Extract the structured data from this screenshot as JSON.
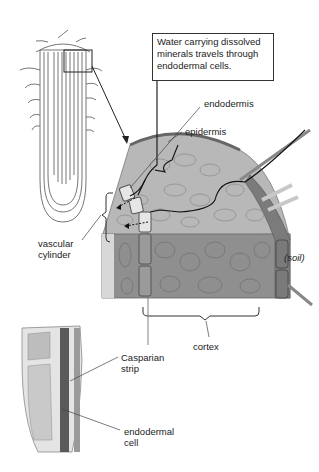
{
  "callout": {
    "lines": [
      "Water carrying dissolved",
      "minerals travels through",
      "endodermal cells."
    ]
  },
  "labels": {
    "endodermis": "endodermis",
    "epidermis": "epidermis",
    "vascular_cylinder": [
      "vascular",
      "cylinder"
    ],
    "soil": "(soil)",
    "cortex": "cortex",
    "casparian_strip": [
      "Casparian",
      "strip"
    ],
    "endodermal_cell": [
      "endodermal",
      "cell"
    ]
  },
  "colors": {
    "tissue_light": "#b8b8b8",
    "tissue_dark": "#8c8c8c",
    "endodermal_cell": "#e6e6e6",
    "casparian_band": "#555555",
    "path_line": "#111111"
  }
}
